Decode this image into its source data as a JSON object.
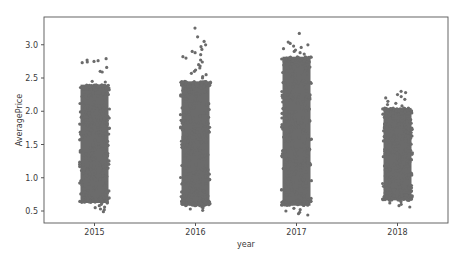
{
  "chart_data": {
    "type": "scatter",
    "subtype": "stripplot",
    "title": "",
    "xlabel": "year",
    "ylabel": "AveragePrice",
    "categories": [
      "2015",
      "2016",
      "2017",
      "2018"
    ],
    "ylim": [
      0.32,
      3.42
    ],
    "yticks": [
      0.5,
      1.0,
      1.5,
      2.0,
      2.5,
      3.0
    ],
    "ytick_labels": [
      "0.5",
      "1.0",
      "1.5",
      "2.0",
      "2.5",
      "3.0"
    ],
    "grid": false,
    "legend": null,
    "point_color": "#6b6b6b",
    "series": [
      {
        "name": "2015",
        "approx_min": 0.49,
        "dense_range": [
          0.62,
          2.4
        ],
        "approx_max": 2.79,
        "outliers_high": [
          2.79,
          2.77,
          2.76,
          2.75,
          2.74,
          2.73,
          2.66,
          2.6,
          2.59,
          2.45,
          2.44
        ],
        "outliers_low": [
          0.49,
          0.52,
          0.53,
          0.55,
          0.56,
          0.58,
          0.6
        ]
      },
      {
        "name": "2016",
        "approx_min": 0.51,
        "dense_range": [
          0.58,
          2.45
        ],
        "approx_max": 3.25,
        "outliers_high": [
          3.25,
          3.12,
          3.05,
          3.0,
          2.97,
          2.93,
          2.9,
          2.88,
          2.85,
          2.82,
          2.8,
          2.77,
          2.74,
          2.7,
          2.68,
          2.65,
          2.62,
          2.6,
          2.57,
          2.55,
          2.52,
          2.5
        ],
        "outliers_low": [
          0.51,
          0.53,
          0.55,
          0.56
        ]
      },
      {
        "name": "2017",
        "approx_min": 0.44,
        "dense_range": [
          0.58,
          2.82
        ],
        "approx_max": 3.17,
        "outliers_high": [
          3.17,
          3.04,
          3.02,
          3.0,
          2.98,
          2.96,
          2.94,
          2.92,
          2.9,
          2.88,
          2.86
        ],
        "outliers_low": [
          0.44,
          0.46,
          0.48,
          0.5,
          0.52,
          0.54
        ]
      },
      {
        "name": "2018",
        "approx_min": 0.56,
        "dense_range": [
          0.66,
          2.05
        ],
        "approx_max": 2.3,
        "outliers_high": [
          2.3,
          2.28,
          2.25,
          2.22,
          2.2,
          2.18,
          2.15,
          2.12,
          2.1,
          2.08
        ],
        "outliers_low": [
          0.56,
          0.58,
          0.6,
          0.62,
          0.64
        ]
      }
    ]
  },
  "axes": {
    "x_tick_labels": [
      "2015",
      "2016",
      "2017",
      "2018"
    ],
    "y_tick_labels": [
      "0.5",
      "1.0",
      "1.5",
      "2.0",
      "2.5",
      "3.0"
    ],
    "xlabel": "year",
    "ylabel": "AveragePrice"
  }
}
